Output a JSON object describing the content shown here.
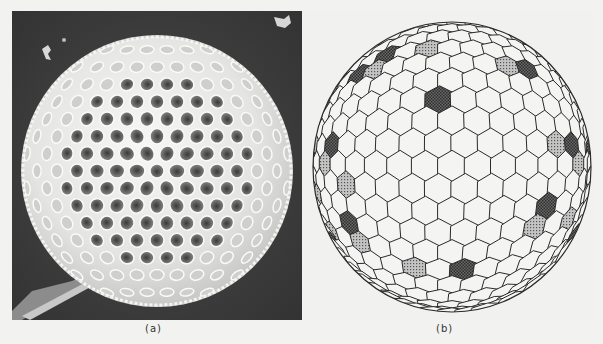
{
  "figure": {
    "panels": [
      {
        "id": "a",
        "caption": "(a)",
        "kind": "photograph",
        "description": "Scanning electron micrograph of a spherical radiolarian-like skeleton with hexagonal pores on a dark background"
      },
      {
        "id": "b",
        "caption": "(b)",
        "kind": "line-diagram",
        "description": "Spherical tessellation of mostly hexagonal cells; non-hexagonal defect cells shaded dark (dense hatching) and lighter (dotted)"
      }
    ],
    "colors": {
      "photo_background": "#3e3e3e",
      "sphere_surface": "#e8e8e6",
      "diagram_background": "#f1f1ef",
      "cell_outline": "#2a2a2a",
      "dark_cell_fill": "#4a4a4a",
      "light_cell_fill": "#9a9a9a"
    }
  }
}
